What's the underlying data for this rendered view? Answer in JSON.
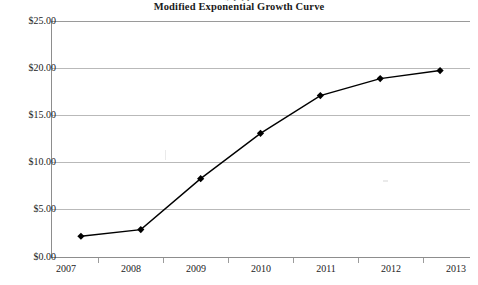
{
  "chart_data": {
    "type": "line",
    "title": "Modified Exponential Growth Curve",
    "xlabel": "",
    "ylabel": "",
    "categories": [
      "2007",
      "2008",
      "2009",
      "2010",
      "2011",
      "2012",
      "2013"
    ],
    "values": [
      2.2,
      2.9,
      8.3,
      13.1,
      17.1,
      18.9,
      19.75
    ],
    "series": [
      {
        "name": "Modified Exponential Growth Curve",
        "values": [
          2.2,
          2.9,
          8.3,
          13.1,
          17.1,
          18.9,
          19.75
        ]
      }
    ],
    "ylim": [
      0,
      25
    ],
    "ytick_labels": [
      "$25.00",
      "$20.00",
      "$15.00",
      "$10.00",
      "$5.00",
      "$0.00"
    ],
    "ytick_values": [
      25,
      20,
      15,
      10,
      5,
      0
    ],
    "grid": true,
    "legend": false,
    "legend_position": "none",
    "marker": "diamond",
    "line_color": "#000000",
    "marker_color": "#000000",
    "grid_color": "#b9b9b9",
    "axis_color": "#8d8d8d",
    "text_color": "#232323"
  },
  "artifacts": {
    "clipped_header_text": "y p  ,   p"
  }
}
